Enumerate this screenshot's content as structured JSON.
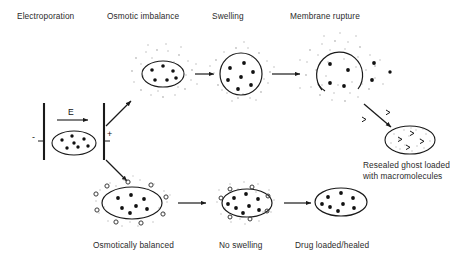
{
  "figure": {
    "type": "process-diagram",
    "background_color": "#ffffff",
    "ink_color": "#1a1a1a",
    "stipple_color": "#b9b9b9"
  },
  "labels": {
    "top": [
      {
        "id": "electroporation",
        "text": "Electroporation",
        "x": 17,
        "y": 11
      },
      {
        "id": "osmotic-imbalance",
        "text": "Osmotic imbalance",
        "x": 107,
        "y": 11
      },
      {
        "id": "swelling",
        "text": "Swelling",
        "x": 212,
        "y": 11
      },
      {
        "id": "membrane-rupture",
        "text": "Membrane rupture",
        "x": 290,
        "y": 11
      }
    ],
    "bottom": [
      {
        "id": "osmotically-balanced",
        "text": "Osmotically balanced",
        "x": 93,
        "y": 240
      },
      {
        "id": "no-swelling",
        "text": "No swelling",
        "x": 219,
        "y": 240
      },
      {
        "id": "drug-loaded-healed",
        "text": "Drug loaded/healed",
        "x": 295,
        "y": 240
      }
    ],
    "ghost_caption": {
      "id": "resealed-ghost-caption",
      "line1": "Resealed ghost loaded",
      "line2": "with macromolecules",
      "x": 363,
      "y": 165
    }
  },
  "electroporation_cell": {
    "field_label": "E",
    "cathode_sign": "-",
    "anode_sign": "+",
    "cathode_x": 44,
    "anode_x": 104,
    "plate_top": 103,
    "plate_bottom": 160,
    "cell": {
      "cx": 74,
      "cy": 143,
      "rx": 22,
      "ry": 12,
      "dots": 7
    }
  },
  "stages": {
    "osmotic_imbalance": {
      "id": "osmotic-imbalance-cell",
      "cx": 163,
      "cy": 74,
      "rx": 21,
      "ry": 13,
      "inner_dots": 6,
      "halo": "stipple",
      "outside_rings": 0
    },
    "swelling": {
      "id": "swelling-cell",
      "cx": 241,
      "cy": 74,
      "r": 21,
      "inner_dots": 7,
      "halo": "stipple"
    },
    "membrane_rupture": {
      "id": "membrane-rupture-cell",
      "cx": 341,
      "cy": 73,
      "r": 23,
      "inner_dots": 4,
      "escaped_dots": 3,
      "halo": "stipple",
      "pores": 2
    },
    "resealed_ghost": {
      "id": "resealed-ghost-cell",
      "cx": 410,
      "cy": 140,
      "rx": 25,
      "ry": 14,
      "macromolecules": 4,
      "fill": "stipple"
    },
    "osmotically_balanced": {
      "id": "osmotically-balanced-cell",
      "cx": 132,
      "cy": 203,
      "rx": 30,
      "ry": 16,
      "inner_dots": 7,
      "outside_rings": 9,
      "halo": "stipple"
    },
    "no_swelling": {
      "id": "no-swelling-cell",
      "cx": 247,
      "cy": 203,
      "rx": 25,
      "ry": 14,
      "inner_dots": 8,
      "rings": 7,
      "halo": "stipple"
    },
    "drug_loaded": {
      "id": "drug-loaded-cell",
      "cx": 341,
      "cy": 202,
      "rx": 26,
      "ry": 14,
      "inner_dots": 8,
      "halo": "none"
    }
  },
  "arrows": [
    {
      "id": "field-arrow",
      "x1": 57,
      "y1": 120,
      "x2": 90,
      "y2": 120
    },
    {
      "id": "branch-up-arrow",
      "x1": 104,
      "y1": 125,
      "x2": 132,
      "y2": 100
    },
    {
      "id": "branch-down-arrow",
      "x1": 104,
      "y1": 160,
      "x2": 128,
      "y2": 183
    },
    {
      "id": "imbalance-to-swelling-arrow",
      "x1": 194,
      "y1": 74,
      "x2": 215,
      "y2": 74
    },
    {
      "id": "swelling-to-rupture-arrow",
      "x1": 272,
      "y1": 74,
      "x2": 302,
      "y2": 74
    },
    {
      "id": "rupture-to-ghost-arrow",
      "x1": 365,
      "y1": 103,
      "x2": 392,
      "y2": 128
    },
    {
      "id": "balanced-to-noswell-arrow",
      "x1": 178,
      "y1": 203,
      "x2": 208,
      "y2": 203
    },
    {
      "id": "noswell-to-drugloaded-arrow",
      "x1": 286,
      "y1": 203,
      "x2": 312,
      "y2": 203
    }
  ]
}
